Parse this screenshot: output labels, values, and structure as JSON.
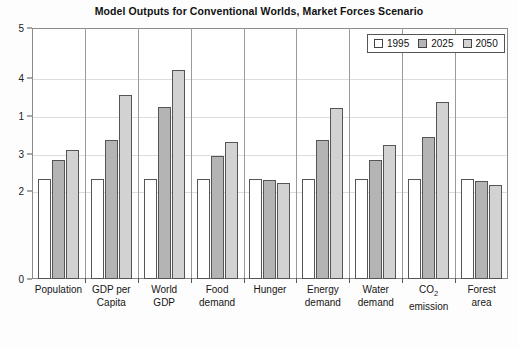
{
  "chart_data": {
    "type": "bar",
    "title": "Model Outputs for Conventional Worlds, Market Forces Scenario",
    "xlabel": "",
    "ylabel": "",
    "grid": true,
    "legend_position": "top-right",
    "categories": [
      "Population",
      "GDP per Capita",
      "World GDP",
      "Food demand",
      "Hunger",
      "Energy demand",
      "Water demand",
      "CO2 emission",
      "Forest area"
    ],
    "category_lines": [
      [
        "Population"
      ],
      [
        "GDP per",
        "Capita"
      ],
      [
        "World",
        "GDP"
      ],
      [
        "Food",
        "demand"
      ],
      [
        "Hunger"
      ],
      [
        "Energy",
        "demand"
      ],
      [
        "Water",
        "demand"
      ],
      [
        "CO",
        "emission"
      ],
      [
        "Forest",
        "area"
      ]
    ],
    "series": [
      {
        "name": "1995",
        "color": "#ffffff",
        "values": [
          2.0,
          2.0,
          2.0,
          2.0,
          2.0,
          2.0,
          2.0,
          2.0,
          2.0
        ]
      },
      {
        "name": "2025",
        "color": "#b4b4b4",
        "values": [
          2.38,
          2.77,
          3.43,
          2.45,
          1.97,
          2.77,
          2.38,
          2.83,
          1.96
        ]
      },
      {
        "name": "2050",
        "color": "#d2d2d2",
        "values": [
          2.57,
          3.67,
          4.17,
          2.72,
          1.92,
          3.41,
          2.67,
          3.52,
          1.87
        ]
      }
    ],
    "ylim": [
      0,
      5
    ],
    "ytick_labels": [
      "5",
      "4",
      "1",
      "3",
      "2",
      "0"
    ],
    "ytick_positions": [
      5,
      4,
      3.25,
      2.5,
      1.75,
      0
    ],
    "axis_note": "y-axis tick labels appear as printed: 5, 4, 1, 3, 2, 0 from top to bottom"
  },
  "legend": {
    "items": [
      {
        "label": "1995",
        "swatch": "white-swatch"
      },
      {
        "label": "2025",
        "swatch": "dark-gray-swatch"
      },
      {
        "label": "2050",
        "swatch": "light-gray-swatch"
      }
    ]
  }
}
